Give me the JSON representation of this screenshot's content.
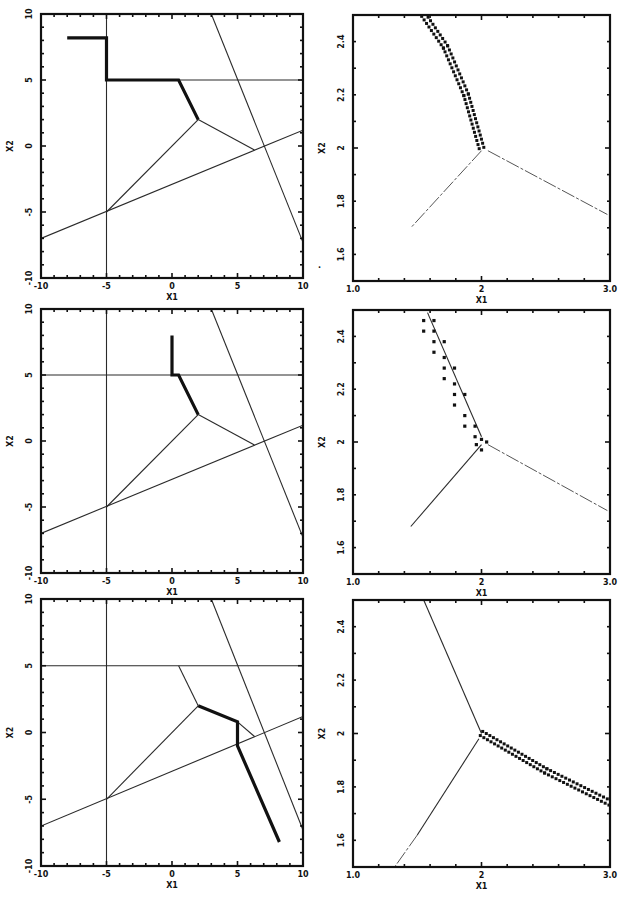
{
  "figure": {
    "panel_count": 6,
    "layout": "3 rows x 2 columns",
    "stray_mark": "."
  },
  "chart_data": [
    {
      "id": "row1-left",
      "type": "line",
      "title": "",
      "xlabel": "X1",
      "ylabel": "X2",
      "xlim": [
        -10,
        10
      ],
      "ylim": [
        -10,
        10
      ],
      "xticks": [
        "-10",
        "-5",
        "0",
        "5",
        "10"
      ],
      "yticks": [
        "10",
        "5",
        "0",
        "-5",
        "-10"
      ],
      "grid": false,
      "series": [
        {
          "name": "constraint-vertical",
          "style": "thin",
          "points": [
            [
              -5,
              -10
            ],
            [
              -5,
              10
            ]
          ]
        },
        {
          "name": "constraint-horizontal",
          "style": "thin",
          "points": [
            [
              -5,
              5
            ],
            [
              10,
              5
            ]
          ]
        },
        {
          "name": "constraint-steep",
          "style": "thin",
          "points": [
            [
              3,
              10
            ],
            [
              10,
              -7.3
            ]
          ]
        },
        {
          "name": "constraint-shallow",
          "style": "thin",
          "points": [
            [
              -10,
              -7.0
            ],
            [
              10,
              1.2
            ]
          ]
        },
        {
          "name": "branch-lower-left",
          "style": "thin",
          "points": [
            [
              2,
              2
            ],
            [
              -5,
              -5
            ]
          ]
        },
        {
          "name": "branch-right",
          "style": "thin",
          "points": [
            [
              2,
              2
            ],
            [
              6.3,
              -0.3
            ]
          ]
        },
        {
          "name": "trajectory",
          "style": "thick",
          "points": [
            [
              -8,
              8.2
            ],
            [
              -5,
              8.2
            ],
            [
              -5,
              5
            ],
            [
              0.5,
              5
            ],
            [
              2,
              2
            ]
          ]
        }
      ]
    },
    {
      "id": "row1-right",
      "type": "scatter",
      "title": "",
      "xlabel": "X1",
      "ylabel": "X2",
      "xlim": [
        1.0,
        3.0
      ],
      "ylim": [
        1.5,
        2.5
      ],
      "xticks": [
        "1.0",
        "2",
        "3.0"
      ],
      "yticks": [
        "2.4",
        "2.2",
        "2",
        "1.8",
        "1.6"
      ],
      "grid": false,
      "series": [
        {
          "name": "branch-up-left",
          "style": "dots-double",
          "points": [
            [
              1.55,
              2.5
            ],
            [
              1.72,
              2.38
            ],
            [
              1.88,
              2.2
            ],
            [
              2.0,
              2.0
            ]
          ]
        },
        {
          "name": "branch-lower-left",
          "style": "faint",
          "points": [
            [
              2.0,
              1.99
            ],
            [
              1.45,
              1.7
            ]
          ]
        },
        {
          "name": "branch-lower-right",
          "style": "faint",
          "points": [
            [
              2.05,
              1.99
            ],
            [
              2.98,
              1.75
            ]
          ]
        }
      ]
    },
    {
      "id": "row2-left",
      "type": "line",
      "title": "",
      "xlabel": "X1",
      "ylabel": "X2",
      "xlim": [
        -10,
        10
      ],
      "ylim": [
        -10,
        10
      ],
      "xticks": [
        "-10",
        "-5",
        "0",
        "5",
        "10"
      ],
      "yticks": [
        "10",
        "5",
        "0",
        "-5",
        "-10"
      ],
      "grid": false,
      "series": [
        {
          "name": "constraint-vertical",
          "style": "thin",
          "points": [
            [
              -5,
              -10
            ],
            [
              -5,
              10
            ]
          ]
        },
        {
          "name": "constraint-horizontal",
          "style": "thin",
          "points": [
            [
              -10,
              5
            ],
            [
              10,
              5
            ]
          ]
        },
        {
          "name": "constraint-steep",
          "style": "thin",
          "points": [
            [
              3,
              10
            ],
            [
              10,
              -7.3
            ]
          ]
        },
        {
          "name": "constraint-shallow",
          "style": "thin",
          "points": [
            [
              -10,
              -7.0
            ],
            [
              10,
              1.2
            ]
          ]
        },
        {
          "name": "branch-lower-left",
          "style": "thin",
          "points": [
            [
              2,
              2
            ],
            [
              -5,
              -5
            ]
          ]
        },
        {
          "name": "branch-right",
          "style": "thin",
          "points": [
            [
              2,
              2
            ],
            [
              6.3,
              -0.3
            ]
          ]
        },
        {
          "name": "trajectory",
          "style": "thick",
          "points": [
            [
              0,
              8.0
            ],
            [
              0,
              5
            ],
            [
              0.5,
              5
            ],
            [
              2,
              2
            ]
          ]
        }
      ]
    },
    {
      "id": "row2-right",
      "type": "scatter",
      "title": "",
      "xlabel": "X1",
      "ylabel": "X2",
      "xlim": [
        1.0,
        3.0
      ],
      "ylim": [
        1.5,
        2.5
      ],
      "xticks": [
        "1.0",
        "2",
        "3.0"
      ],
      "yticks": [
        "2.4",
        "2.2",
        "2",
        "1.8",
        "1.6"
      ],
      "grid": false,
      "series": [
        {
          "name": "fit-line",
          "style": "thin",
          "points": [
            [
              1.58,
              2.49
            ],
            [
              2.0,
              2.02
            ]
          ]
        },
        {
          "name": "samples",
          "style": "dots-scatter",
          "points": [
            [
              1.55,
              2.46
            ],
            [
              1.63,
              2.46
            ],
            [
              1.55,
              2.42
            ],
            [
              1.63,
              2.42
            ],
            [
              1.63,
              2.38
            ],
            [
              1.71,
              2.38
            ],
            [
              1.63,
              2.34
            ],
            [
              1.71,
              2.32
            ],
            [
              1.71,
              2.28
            ],
            [
              1.79,
              2.28
            ],
            [
              1.71,
              2.24
            ],
            [
              1.79,
              2.22
            ],
            [
              1.79,
              2.18
            ],
            [
              1.87,
              2.18
            ],
            [
              1.79,
              2.14
            ],
            [
              1.87,
              2.1
            ],
            [
              1.87,
              2.06
            ],
            [
              1.95,
              2.06
            ],
            [
              1.95,
              2.02
            ],
            [
              2.0,
              2.01
            ],
            [
              2.04,
              2.0
            ],
            [
              1.96,
              1.99
            ],
            [
              2.0,
              1.97
            ]
          ]
        },
        {
          "name": "branch-lower-left",
          "style": "thin",
          "points": [
            [
              2.0,
              1.99
            ],
            [
              1.45,
              1.68
            ]
          ]
        },
        {
          "name": "branch-lower-right",
          "style": "faint",
          "points": [
            [
              2.05,
              1.99
            ],
            [
              2.98,
              1.74
            ]
          ]
        }
      ]
    },
    {
      "id": "row3-left",
      "type": "line",
      "title": "",
      "xlabel": "X1",
      "ylabel": "X2",
      "xlim": [
        -10,
        10
      ],
      "ylim": [
        -10,
        10
      ],
      "xticks": [
        "-10",
        "-5",
        "0",
        "5",
        "10"
      ],
      "yticks": [
        "10",
        "5",
        "0",
        "-5",
        "-10"
      ],
      "grid": false,
      "series": [
        {
          "name": "constraint-vertical",
          "style": "thin",
          "points": [
            [
              -5,
              -10
            ],
            [
              -5,
              10
            ]
          ]
        },
        {
          "name": "constraint-horizontal",
          "style": "thin",
          "points": [
            [
              -10,
              5
            ],
            [
              10,
              5
            ]
          ]
        },
        {
          "name": "constraint-steep",
          "style": "thin",
          "points": [
            [
              3,
              10
            ],
            [
              10,
              -7.3
            ]
          ]
        },
        {
          "name": "constraint-shallow",
          "style": "thin",
          "points": [
            [
              -10,
              -7.0
            ],
            [
              10,
              1.2
            ]
          ]
        },
        {
          "name": "branch-lower-left",
          "style": "thin",
          "points": [
            [
              2,
              2
            ],
            [
              -5,
              -5
            ]
          ]
        },
        {
          "name": "branch-upper",
          "style": "thin",
          "points": [
            [
              2,
              2
            ],
            [
              0.5,
              5
            ]
          ]
        },
        {
          "name": "branch-right",
          "style": "thin",
          "points": [
            [
              5,
              0.8
            ],
            [
              6.3,
              -0.3
            ]
          ]
        },
        {
          "name": "trajectory",
          "style": "thick",
          "points": [
            [
              2,
              2
            ],
            [
              5,
              0.8
            ],
            [
              5,
              -1
            ],
            [
              8.2,
              -8.2
            ]
          ]
        }
      ]
    },
    {
      "id": "row3-right",
      "type": "scatter",
      "title": "",
      "xlabel": "X1",
      "ylabel": "X2",
      "xlim": [
        1.0,
        3.0
      ],
      "ylim": [
        1.5,
        2.5
      ],
      "xticks": [
        "1.0",
        "2",
        "3.0"
      ],
      "yticks": [
        "2.4",
        "2.2",
        "2",
        "1.8",
        "1.6"
      ],
      "grid": false,
      "series": [
        {
          "name": "branch-up-left",
          "style": "thin",
          "points": [
            [
              1.55,
              2.5
            ],
            [
              2.0,
              2.0
            ]
          ]
        },
        {
          "name": "branch-lower-left",
          "style": "thin",
          "points": [
            [
              1.98,
              1.98
            ],
            [
              1.5,
              1.62
            ]
          ]
        },
        {
          "name": "branch-lower-left-faint",
          "style": "faint",
          "points": [
            [
              1.5,
              1.62
            ],
            [
              1.25,
              1.45
            ]
          ]
        },
        {
          "name": "branch-lower-right",
          "style": "dots-double",
          "points": [
            [
              2.0,
              2.0
            ],
            [
              2.5,
              1.86
            ],
            [
              3.0,
              1.74
            ]
          ]
        }
      ]
    }
  ]
}
